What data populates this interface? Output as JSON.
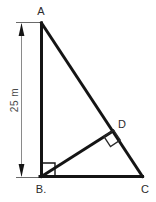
{
  "figure": {
    "background_color": "#ffffff",
    "stroke_color": "#1a1a1a",
    "dimension_color": "#5a5a5a",
    "label_color": "#2b2b2b"
  },
  "dimension": {
    "label": "25 m",
    "value": 25,
    "unit": "m",
    "orientation": "vertical",
    "measures": "AB",
    "arrow_style": "double-headed"
  },
  "vertices": [
    {
      "id": "A",
      "label": "A",
      "x": 41,
      "y": 23
    },
    {
      "id": "B",
      "label": "B.",
      "x": 41,
      "y": 176
    },
    {
      "id": "C",
      "label": "C",
      "x": 142,
      "y": 176
    },
    {
      "id": "D",
      "label": "D",
      "x": 113,
      "y": 131
    }
  ],
  "segments": [
    {
      "name": "AB",
      "from": "A",
      "to": "B"
    },
    {
      "name": "AC",
      "from": "A",
      "to": "C"
    },
    {
      "name": "BC",
      "from": "B",
      "to": "C"
    },
    {
      "name": "BD",
      "from": "B",
      "to": "D"
    }
  ],
  "right_angles": [
    {
      "at": "B",
      "between": "AB and BC",
      "style": "square"
    },
    {
      "at": "D",
      "between": "BD and AC",
      "style": "square-rotated"
    }
  ]
}
